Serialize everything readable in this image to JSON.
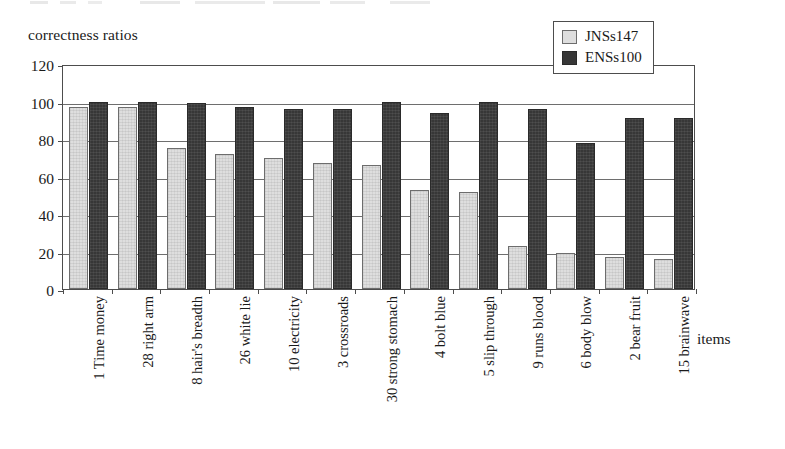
{
  "chart_data": {
    "type": "bar",
    "title": "",
    "ylabel": "correctness ratios",
    "xlabel": "items",
    "ylim": [
      0,
      120
    ],
    "yticks": [
      0,
      20,
      40,
      60,
      80,
      100,
      120
    ],
    "grid": true,
    "legend_position": "top-right",
    "categories": [
      "1 Time money",
      "28 right arm",
      "8 hair's breadth",
      "26 white lie",
      "10 electricity",
      "3 crossroads",
      "30 strong stomach",
      "4 bolt blue",
      "5 slip through",
      "9 runs blood",
      "6 body blow",
      "2 bear fruit",
      "15 brainwave"
    ],
    "series": [
      {
        "name": "JNSs147",
        "color": "#dedede",
        "values": [
          97,
          97,
          75,
          72,
          70,
          67,
          66,
          53,
          52,
          23,
          19,
          17,
          16
        ]
      },
      {
        "name": "ENSs100",
        "color": "#373737",
        "values": [
          100,
          100,
          99,
          97,
          96,
          96,
          100,
          94,
          100,
          96,
          78,
          91,
          91
        ]
      }
    ]
  },
  "legend": {
    "items": [
      {
        "label": "JNSs147",
        "swatch": "light-gray-swatch-icon"
      },
      {
        "label": "ENSs100",
        "swatch": "dark-gray-swatch-icon"
      }
    ]
  },
  "axes": {
    "y_title": "correctness ratios",
    "x_title": "items",
    "y_tick_labels": [
      "0",
      "20",
      "40",
      "60",
      "80",
      "100",
      "120"
    ]
  }
}
